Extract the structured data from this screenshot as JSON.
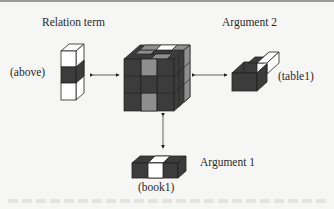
{
  "diagram": {
    "labels": {
      "relation_term": "Relation term",
      "relation_value": "(above)",
      "argument2": "Argument 2",
      "argument2_value": "(table1)",
      "argument1": "Argument 1",
      "argument1_value": "(book1)"
    },
    "colors": {
      "dark": "#3c3c3c",
      "mid": "#8e8e8e",
      "light": "#ffffff",
      "line": "#222222",
      "background": "#f6f6f4"
    }
  }
}
